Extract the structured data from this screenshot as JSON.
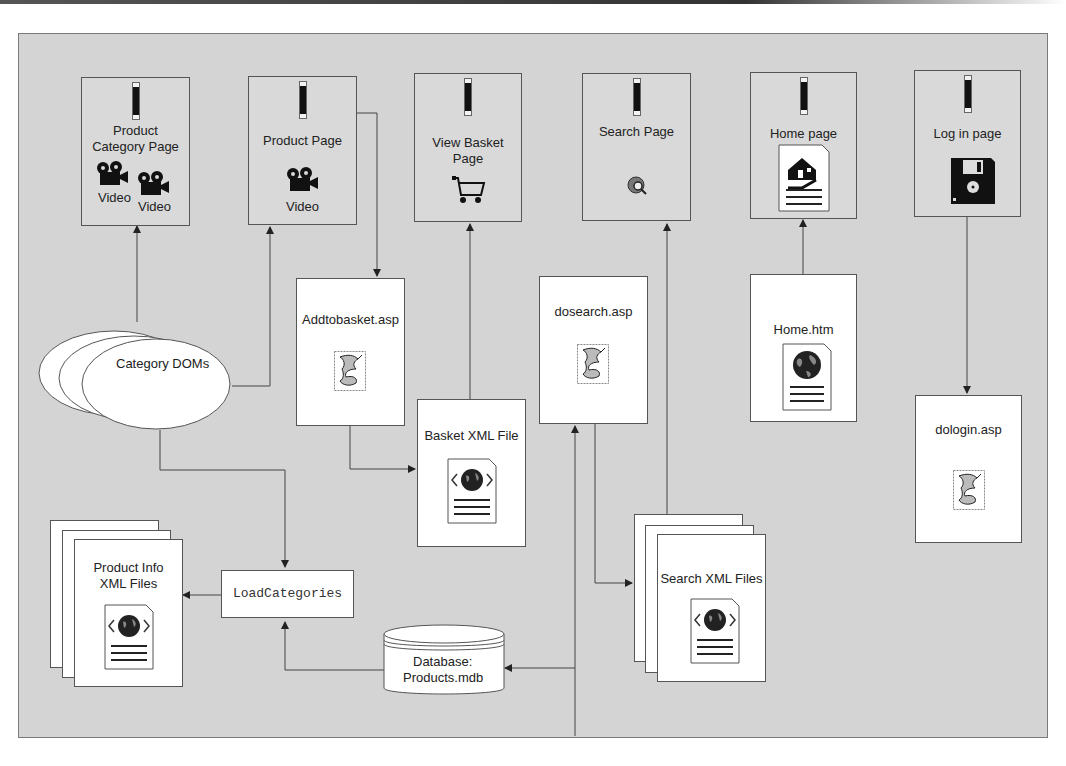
{
  "diagram": {
    "pages": [
      {
        "id": "product-category-page",
        "label_line1": "Product",
        "label_line2": "Category Page",
        "media": [
          "Video",
          "Video"
        ]
      },
      {
        "id": "product-page",
        "label": "Product Page",
        "media": [
          "Video"
        ]
      },
      {
        "id": "view-basket-page",
        "label_line1": "View Basket",
        "label_line2": "Page",
        "icon": "shopping-cart-icon"
      },
      {
        "id": "search-page",
        "label": "Search Page",
        "icon": "search-icon"
      },
      {
        "id": "home-page",
        "label": "Home page",
        "icon": "home-document-icon"
      },
      {
        "id": "login-page",
        "label": "Log in page",
        "icon": "floppy-disk-icon"
      }
    ],
    "files": {
      "addtobasket": {
        "label": "Addtobasket.asp",
        "icon": "script-icon"
      },
      "dosearch": {
        "label": "dosearch.asp",
        "icon": "script-icon"
      },
      "home_htm": {
        "label": "Home.htm",
        "icon": "web-document-icon"
      },
      "dologin": {
        "label": "dologin.asp",
        "icon": "script-icon"
      },
      "basket_xml": {
        "label": "Basket XML File",
        "icon": "xml-document-icon"
      },
      "product_info_xml": {
        "label_line1": "Product Info",
        "label_line2": "XML Files",
        "icon": "xml-document-icon"
      },
      "search_xml": {
        "label": "Search XML Files",
        "icon": "xml-document-icon"
      }
    },
    "category_doms": {
      "label": "Category DOMs"
    },
    "load_categories": {
      "label": "LoadCategories"
    },
    "database": {
      "label_line1": "Database:",
      "label_line2": "Products.mdb"
    }
  }
}
